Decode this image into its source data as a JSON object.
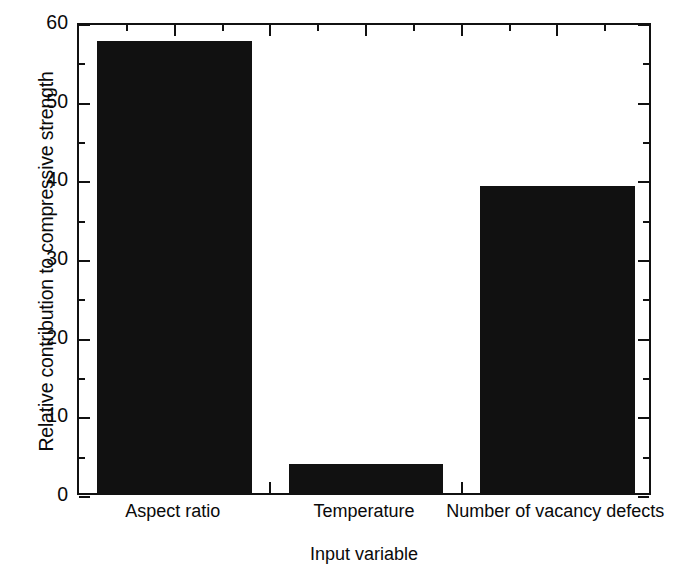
{
  "chart_data": {
    "type": "bar",
    "title": "",
    "categories": [
      "Aspect ratio",
      "Temperature",
      "Number of vacancy defects"
    ],
    "values": [
      57.5,
      3.7,
      39.0
    ],
    "xlabel": "Input variable",
    "ylabel": "Relative contribution to compressive strength",
    "ylim": [
      0,
      60
    ],
    "ytick_labels": [
      "0",
      "10",
      "20",
      "30",
      "40",
      "50",
      "60"
    ],
    "ytick_values": [
      0,
      10,
      20,
      30,
      40,
      50,
      60
    ],
    "yminor_interval": 5,
    "grid": false,
    "legend": null,
    "bar_color": "#111111",
    "frame_color": "#111111",
    "background": "#ffffff"
  }
}
